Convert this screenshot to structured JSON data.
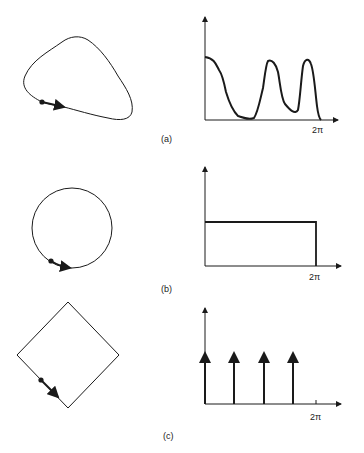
{
  "figure": {
    "panels": [
      {
        "id": "a",
        "label": "(a)",
        "shape": "irregular closed curve",
        "spectrum": "continuous, multi-peaked",
        "x_end_label": "2π"
      },
      {
        "id": "b",
        "label": "(b)",
        "shape": "circle",
        "spectrum": "constant (flat)",
        "x_end_label": "2π"
      },
      {
        "id": "c",
        "label": "(c)",
        "shape": "square (diamond orientation)",
        "spectrum": "four impulses",
        "x_end_label": "2π"
      }
    ]
  },
  "colors": {
    "stroke": "#1a1a1a",
    "background": "#ffffff"
  }
}
